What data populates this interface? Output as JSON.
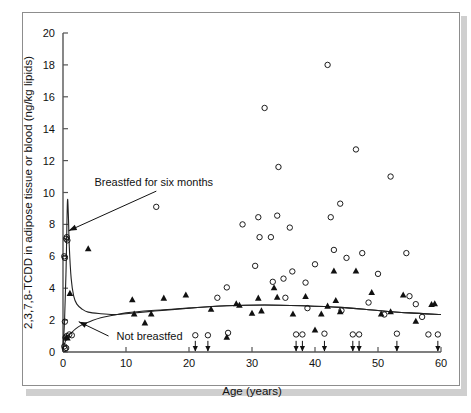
{
  "figure": {
    "axis_title_x": "Age (years)",
    "axis_title_y": "2,3,7,8-TCDD in adipose tissue or blood (ng/kg lipids)",
    "annotation_breastfed": "Breastfed for six months",
    "annotation_not_breastfed": "Not breastfed",
    "colors": {
      "frame": "#8d8d8d",
      "axis": "#555555",
      "marker": "#111111",
      "curve": "#222222",
      "shadow": "#cfcfcf",
      "background": "#ffffff"
    }
  },
  "chart_data": {
    "type": "scatter",
    "title": "",
    "subtitle": "",
    "xlabel": "Age (years)",
    "ylabel": "2,3,7,8-TCDD in adipose tissue or blood (ng/kg lipids)",
    "xlim": [
      0,
      60
    ],
    "ylim": [
      0,
      20
    ],
    "xticks": [
      0,
      10,
      20,
      30,
      40,
      50,
      60
    ],
    "yticks": [
      0,
      2,
      4,
      6,
      8,
      10,
      12,
      14,
      16,
      18,
      20
    ],
    "grid": false,
    "legend": "none",
    "annotations": [
      {
        "text": "Breastfed for six months",
        "text_x": 5.0,
        "text_y": 10.4,
        "arrow_to_x": 0.9,
        "arrow_to_y": 7.6
      },
      {
        "text": "Not breastfed",
        "text_x": 8.5,
        "text_y": 0.75,
        "arrow_to_x": 2.5,
        "arrow_to_y": 1.9
      }
    ],
    "series": [
      {
        "name": "open-circle-observations",
        "marker": "open-circle",
        "points": [
          [
            0.2,
            6.0
          ],
          [
            0.3,
            5.9
          ],
          [
            0.5,
            7.1
          ],
          [
            0.6,
            7.2
          ],
          [
            0.7,
            7.0
          ],
          [
            0.3,
            1.9
          ],
          [
            0.4,
            0.9
          ],
          [
            0.6,
            1.0
          ],
          [
            1.0,
            1.1
          ],
          [
            1.4,
            1.05
          ],
          [
            0.2,
            0.35
          ],
          [
            0.3,
            0.2
          ],
          [
            0.5,
            0.25
          ],
          [
            14.8,
            9.1
          ],
          [
            21.0,
            1.05
          ],
          [
            23.0,
            1.05
          ],
          [
            24.5,
            3.4
          ],
          [
            26.0,
            4.05
          ],
          [
            26.2,
            1.2
          ],
          [
            28.5,
            8.0
          ],
          [
            30.5,
            5.4
          ],
          [
            31.0,
            8.45
          ],
          [
            31.2,
            7.2
          ],
          [
            32.0,
            15.3
          ],
          [
            33.0,
            7.2
          ],
          [
            33.3,
            4.4
          ],
          [
            34.0,
            8.55
          ],
          [
            34.2,
            11.6
          ],
          [
            35.0,
            4.6
          ],
          [
            35.3,
            3.4
          ],
          [
            36.0,
            7.8
          ],
          [
            36.4,
            5.05
          ],
          [
            37.0,
            1.1
          ],
          [
            38.0,
            1.1
          ],
          [
            38.5,
            4.35
          ],
          [
            38.8,
            2.75
          ],
          [
            40.0,
            5.5
          ],
          [
            41.5,
            1.15
          ],
          [
            42.0,
            18.0
          ],
          [
            42.5,
            8.45
          ],
          [
            43.0,
            6.4
          ],
          [
            44.0,
            9.3
          ],
          [
            44.2,
            2.6
          ],
          [
            45.0,
            5.9
          ],
          [
            46.0,
            1.1
          ],
          [
            47.0,
            1.1
          ],
          [
            46.5,
            12.7
          ],
          [
            47.5,
            6.2
          ],
          [
            48.5,
            3.1
          ],
          [
            50.0,
            4.9
          ],
          [
            51.0,
            2.35
          ],
          [
            52.0,
            11.0
          ],
          [
            53.0,
            1.15
          ],
          [
            54.5,
            6.2
          ],
          [
            55.0,
            3.5
          ],
          [
            56.0,
            3.0
          ],
          [
            57.0,
            2.2
          ],
          [
            58.0,
            1.1
          ],
          [
            59.5,
            1.1
          ]
        ]
      },
      {
        "name": "filled-triangle-observations",
        "marker": "filled-triangle",
        "points": [
          [
            0.55,
            0.95
          ],
          [
            0.7,
            0.9
          ],
          [
            1.1,
            3.7
          ],
          [
            4.0,
            6.5
          ],
          [
            11.0,
            3.3
          ],
          [
            11.3,
            2.4
          ],
          [
            13.0,
            1.85
          ],
          [
            14.0,
            2.4
          ],
          [
            16.0,
            3.4
          ],
          [
            19.5,
            3.6
          ],
          [
            23.5,
            2.7
          ],
          [
            26.0,
            0.95
          ],
          [
            27.5,
            3.05
          ],
          [
            28.0,
            2.95
          ],
          [
            30.0,
            2.45
          ],
          [
            31.0,
            3.4
          ],
          [
            31.5,
            2.6
          ],
          [
            33.5,
            4.05
          ],
          [
            34.0,
            3.45
          ],
          [
            36.5,
            2.4
          ],
          [
            38.5,
            3.5
          ],
          [
            40.0,
            1.4
          ],
          [
            41.0,
            2.4
          ],
          [
            42.0,
            2.9
          ],
          [
            43.0,
            5.1
          ],
          [
            43.3,
            3.25
          ],
          [
            44.0,
            2.55
          ],
          [
            46.5,
            5.1
          ],
          [
            49.0,
            3.75
          ],
          [
            50.5,
            2.4
          ],
          [
            52.0,
            2.55
          ],
          [
            54.0,
            3.6
          ],
          [
            56.0,
            1.95
          ],
          [
            58.5,
            3.0
          ],
          [
            59.0,
            3.05
          ]
        ]
      }
    ],
    "censored_markers": {
      "description": "downward arrows at baseline indicating values below detection limit",
      "x_values": [
        21.0,
        23.0,
        37.0,
        38.0,
        41.5,
        46.0,
        47.0,
        53.0,
        59.5
      ]
    },
    "fitted_curves": [
      {
        "name": "Breastfed for six months",
        "points": [
          [
            0.0,
            0.3
          ],
          [
            0.25,
            2.0
          ],
          [
            0.5,
            5.4
          ],
          [
            0.7,
            9.4
          ],
          [
            0.85,
            8.6
          ],
          [
            1.0,
            6.6
          ],
          [
            1.3,
            4.6
          ],
          [
            1.7,
            3.5
          ],
          [
            2.2,
            3.0
          ],
          [
            3.0,
            2.7
          ],
          [
            4.0,
            2.5
          ],
          [
            6.0,
            2.4
          ],
          [
            8.0,
            2.35
          ],
          [
            10.0,
            2.4
          ],
          [
            14.0,
            2.55
          ],
          [
            20.0,
            2.75
          ],
          [
            26.0,
            2.9
          ],
          [
            32.0,
            2.95
          ],
          [
            38.0,
            2.9
          ],
          [
            44.0,
            2.8
          ],
          [
            50.0,
            2.6
          ],
          [
            55.0,
            2.45
          ],
          [
            60.0,
            2.35
          ]
        ]
      },
      {
        "name": "Not breastfed",
        "points": [
          [
            0.0,
            0.2
          ],
          [
            0.4,
            0.7
          ],
          [
            0.8,
            1.0
          ],
          [
            1.2,
            1.15
          ],
          [
            2.0,
            1.45
          ],
          [
            3.0,
            1.7
          ],
          [
            4.5,
            1.95
          ],
          [
            6.0,
            2.15
          ],
          [
            8.0,
            2.3
          ],
          [
            10.0,
            2.45
          ],
          [
            14.0,
            2.6
          ],
          [
            20.0,
            2.75
          ],
          [
            26.0,
            2.9
          ],
          [
            32.0,
            2.95
          ],
          [
            38.0,
            2.9
          ],
          [
            44.0,
            2.8
          ],
          [
            50.0,
            2.6
          ],
          [
            55.0,
            2.45
          ],
          [
            60.0,
            2.35
          ]
        ]
      }
    ]
  }
}
